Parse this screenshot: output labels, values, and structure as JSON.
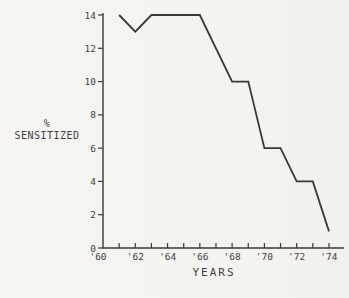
{
  "figure": {
    "ylabel_line1": "%",
    "ylabel_line2": "SENSITIZED",
    "xlabel": "YEARS"
  },
  "chart_data": {
    "type": "line",
    "title": "",
    "xlabel": "YEARS",
    "ylabel": "% SENSITIZED",
    "xlim": [
      1960,
      1974
    ],
    "ylim": [
      0,
      14
    ],
    "grid": false,
    "legend": "none",
    "y_ticks": [
      0,
      2,
      4,
      6,
      8,
      10,
      12,
      14
    ],
    "x_tick_values": [
      1960,
      1962,
      1964,
      1966,
      1968,
      1970,
      1972,
      1974
    ],
    "x_tick_labels": [
      "'60",
      "'62",
      "'64",
      "'66",
      "'68",
      "'70",
      "'72",
      "'74"
    ],
    "x_minor_tick_years": [
      1961,
      1962,
      1963,
      1964,
      1965,
      1966,
      1967,
      1968,
      1969,
      1970,
      1971,
      1972,
      1973,
      1974
    ],
    "series": [
      {
        "name": "% sensitized",
        "x": [
          1961,
          1962,
          1963,
          1966,
          1968,
          1969,
          1970,
          1971,
          1972,
          1973,
          1974
        ],
        "y": [
          14,
          13,
          14,
          14,
          10,
          10,
          6,
          6,
          4,
          4,
          1
        ]
      }
    ],
    "line_color": "#383838",
    "axis_color": "#3a3a3a",
    "background": "#f5f4f1"
  }
}
